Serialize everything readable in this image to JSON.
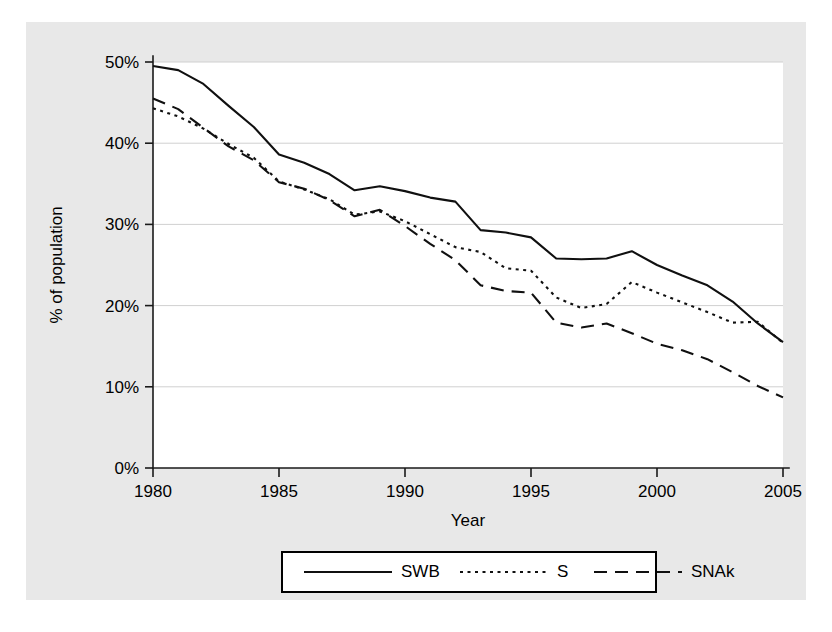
{
  "chart_data": {
    "type": "line",
    "title": "",
    "xlabel": "Year",
    "ylabel": "% of population",
    "xlim": [
      1980,
      2005
    ],
    "ylim": [
      0,
      50
    ],
    "grid": true,
    "legend_position": "bottom",
    "x_ticks": [
      "1980",
      "1985",
      "1990",
      "1995",
      "2000",
      "2005"
    ],
    "x_tick_values": [
      1980,
      1985,
      1990,
      1995,
      2000,
      2005
    ],
    "y_ticks": [
      "0%",
      "10%",
      "20%",
      "30%",
      "40%",
      "50%"
    ],
    "y_tick_values": [
      0,
      10,
      20,
      30,
      40,
      50
    ],
    "x": [
      1980,
      1981,
      1982,
      1983,
      1984,
      1985,
      1986,
      1987,
      1988,
      1989,
      1990,
      1991,
      1992,
      1993,
      1994,
      1995,
      1996,
      1997,
      1998,
      1999,
      2000,
      2001,
      2002,
      2003,
      2004,
      2005
    ],
    "series": [
      {
        "name": "SWB",
        "style": "solid",
        "values": [
          49.5,
          49.0,
          47.3,
          44.6,
          42.0,
          38.6,
          37.6,
          36.2,
          34.2,
          34.7,
          34.1,
          33.3,
          32.8,
          29.3,
          29.0,
          28.4,
          25.8,
          25.7,
          25.8,
          26.7,
          25.0,
          23.7,
          22.5,
          20.5,
          17.8,
          15.5
        ]
      },
      {
        "name": "S",
        "style": "dotted",
        "values": [
          44.3,
          43.3,
          41.8,
          39.9,
          38.2,
          35.3,
          34.3,
          33.1,
          31.2,
          31.6,
          30.4,
          28.8,
          27.2,
          26.6,
          24.6,
          24.3,
          21.0,
          19.7,
          20.2,
          22.9,
          21.6,
          20.4,
          19.2,
          17.9,
          18.0,
          15.4
        ]
      },
      {
        "name": "SNAk",
        "style": "dashed",
        "values": [
          45.5,
          44.2,
          41.9,
          39.6,
          37.9,
          35.2,
          34.4,
          33.0,
          31.0,
          31.8,
          29.8,
          27.6,
          25.6,
          22.5,
          21.8,
          21.6,
          17.9,
          17.3,
          17.8,
          16.6,
          15.3,
          14.5,
          13.4,
          11.8,
          10.1,
          8.7
        ]
      }
    ],
    "legend": [
      {
        "label": "SWB",
        "style": "solid"
      },
      {
        "label": "S",
        "style": "dotted"
      },
      {
        "label": "SNAk",
        "style": "dashed"
      }
    ],
    "colors": {
      "line": "#101010",
      "grid": "#d0d0d0",
      "axis": "#1a1a1a",
      "panel_background": "#e8e8e8",
      "plot_background": "#ffffff"
    }
  }
}
